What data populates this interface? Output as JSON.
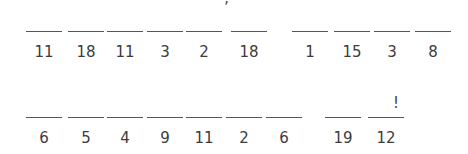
{
  "puzzle": {
    "rows": [
      {
        "words": [
          {
            "numbers": [
              "11",
              "18",
              "11",
              "3",
              "2",
              "18"
            ]
          },
          {
            "numbers": [
              "1",
              "15",
              "3",
              "8"
            ]
          }
        ],
        "punctuation": [
          {
            "char": "’",
            "after_index": 4
          }
        ]
      },
      {
        "words": [
          {
            "numbers": [
              "6",
              "5",
              "4",
              "9",
              "11",
              "2",
              "6"
            ]
          },
          {
            "numbers": [
              "19",
              "12"
            ]
          }
        ],
        "punctuation": [
          {
            "char": "!",
            "after_index": 8
          }
        ]
      }
    ]
  }
}
